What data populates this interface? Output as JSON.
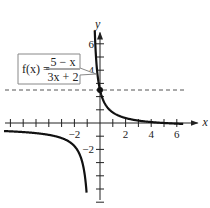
{
  "chart_data": {
    "type": "line",
    "title": "",
    "function_label": "f(x) = (5 - x)/(3x + 2)",
    "callout": {
      "lhs": "f(x) =",
      "numerator": "5 − x",
      "denominator": "3x + 2"
    },
    "xlabel": "x",
    "ylabel": "y",
    "xlim": [
      -7.5,
      7
    ],
    "ylim": [
      -6.5,
      7
    ],
    "x_ticks": [
      -7,
      -6,
      -5,
      -4,
      -3,
      -2,
      -1,
      1,
      2,
      3,
      4,
      5,
      6
    ],
    "x_tick_labels": [
      {
        "value": -2,
        "label": "−2"
      },
      {
        "value": 2,
        "label": "2"
      },
      {
        "value": 4,
        "label": "4"
      },
      {
        "value": 6,
        "label": "6"
      }
    ],
    "y_ticks": [
      -6,
      -5,
      -4,
      -3,
      -2,
      -1,
      1,
      2,
      3,
      4,
      5,
      6
    ],
    "y_tick_labels": [
      {
        "value": -2,
        "label": "−2"
      },
      {
        "value": 4,
        "label": "4"
      },
      {
        "value": 6,
        "label": "6"
      }
    ],
    "vertical_asymptote": -0.6667,
    "dashed_line_y": 2.5,
    "highlight_point": {
      "x": 0,
      "y": 2.5
    },
    "series": [
      {
        "name": "f(x) right branch",
        "x": [
          -0.2,
          0,
          0.5,
          1,
          2,
          3,
          4,
          5,
          6,
          6.5
        ],
        "y": [
          3.8,
          2.5,
          1.29,
          0.8,
          0.375,
          0.18,
          0.07,
          0,
          -0.05,
          -0.07
        ]
      },
      {
        "name": "f(x) left branch",
        "x": [
          -7.5,
          -6,
          -4,
          -3,
          -2,
          -1.5,
          -1,
          -0.8
        ],
        "y": [
          -0.6,
          -0.69,
          -0.9,
          -1.14,
          -1.75,
          -2.6,
          -6,
          -14.5
        ]
      }
    ],
    "grid": false,
    "legend": "none"
  }
}
